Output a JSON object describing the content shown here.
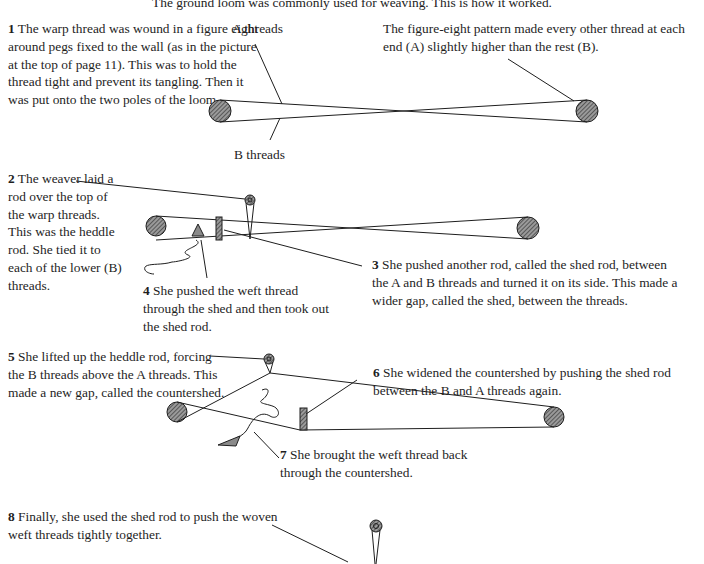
{
  "intro": "The ground loom was commonly used for weaving. This is how it worked.",
  "labels": {
    "a_threads": "A threads",
    "b_threads": "B threads",
    "figure_eight_note": "The figure-eight pattern made every other thread at each end (A) slightly higher than the rest (B)."
  },
  "steps": [
    {
      "num": "1",
      "text": "The warp thread was wound in a figure eight around pegs fixed to the wall (as in the picture at the top of page 11). This was to hold the thread tight and prevent its tangling. Then it was put onto the two poles of the loom."
    },
    {
      "num": "2",
      "text": "The weaver laid a rod over the top of the warp threads. This was the heddle rod. She tied it to each of the lower (B) threads."
    },
    {
      "num": "3",
      "text": "She pushed another rod, called the shed rod, between the A and B threads and turned it on its side. This made a wider gap, called the shed, between the threads."
    },
    {
      "num": "4",
      "text": "She pushed the weft thread through the shed and then took out the shed rod."
    },
    {
      "num": "5",
      "text": "She lifted up the heddle rod, forcing the B threads above the A threads. This made a new gap, called the countershed."
    },
    {
      "num": "6",
      "text": "She widened the countershed by pushing the shed rod between the B and A threads again."
    },
    {
      "num": "7",
      "text": "She brought the weft thread back through the countershed."
    },
    {
      "num": "8",
      "text": "Finally, she used the shed rod to push the woven weft threads tightly together."
    }
  ],
  "colors": {
    "ink": "#1e1e1e",
    "hatch_fill": "#6e6e6e",
    "weft_arrow": "#8a8a8a"
  }
}
